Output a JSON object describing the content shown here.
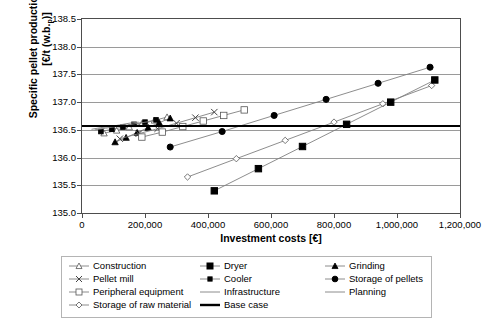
{
  "axes": {
    "ylabel_line1": "Specific pellet production costs",
    "ylabel_line2_pre": "[€/t (w.b.",
    "ylabel_line2_sub": "p",
    "ylabel_line2_post": ")]",
    "ylabel_full": "Specific pellet production costs [€/t (w.b.)p]",
    "xlabel": "Investment costs [€]",
    "yticks": [
      "135.0",
      "135.5",
      "136.0",
      "136.5",
      "137.0",
      "137.5",
      "138.0",
      "138.5"
    ],
    "xticks": [
      "0",
      "200,000",
      "400,000",
      "600,000",
      "800,000",
      "1,000,000",
      "1,200,000"
    ]
  },
  "legend": {
    "entries": [
      {
        "label": "Construction",
        "marker": "open-triangle",
        "col": 0,
        "row": 0
      },
      {
        "label": "Dryer",
        "marker": "filled-square",
        "col": 1,
        "row": 0
      },
      {
        "label": "Grinding",
        "marker": "filled-triangle",
        "col": 2,
        "row": 0
      },
      {
        "label": "Pellet mill",
        "marker": "cross",
        "col": 0,
        "row": 1
      },
      {
        "label": "Cooler",
        "marker": "small-filled-square",
        "col": 1,
        "row": 1
      },
      {
        "label": "Storage of pellets",
        "marker": "filled-circle",
        "col": 2,
        "row": 1
      },
      {
        "label": "Peripheral equipment",
        "marker": "open-square",
        "col": 0,
        "row": 2
      },
      {
        "label": "Infrastructure",
        "marker": "line",
        "col": 1,
        "row": 2
      },
      {
        "label": "Planning",
        "marker": "line",
        "col": 2,
        "row": 2
      },
      {
        "label": "Storage of raw material",
        "marker": "open-diamond",
        "col": 0,
        "row": 3
      },
      {
        "label": "Base case",
        "marker": "thick-line",
        "col": 1,
        "row": 3
      }
    ]
  },
  "colors": {
    "axis": "#4d4d4d",
    "grid": "#9a9a9a",
    "series": "#808080",
    "marker_fill_dark": "#000000",
    "marker_fill_open": "#ffffff",
    "base_case": "#000000"
  },
  "chart_data": {
    "type": "scatter",
    "title": "",
    "xlabel": "Investment costs [€]",
    "ylabel": "Specific pellet production costs [€/t (w.b.)p]",
    "xlim": [
      0,
      1200000
    ],
    "ylim": [
      135.0,
      138.5
    ],
    "grid": true,
    "legend_position": "below",
    "base_case": {
      "label": "Base case",
      "y": 136.57
    },
    "series": [
      {
        "name": "Construction",
        "marker": "open-triangle",
        "x": [
          70000,
          110000,
          150000,
          190000,
          230000,
          270000
        ],
        "y": [
          136.44,
          136.49,
          136.55,
          136.61,
          136.67,
          136.73
        ]
      },
      {
        "name": "Grinding",
        "marker": "filled-triangle",
        "x": [
          105000,
          140000,
          175000,
          210000,
          245000,
          280000
        ],
        "y": [
          136.28,
          136.36,
          136.45,
          136.54,
          136.63,
          136.71
        ]
      },
      {
        "name": "Pellet mill",
        "marker": "cross",
        "x": [
          120000,
          180000,
          240000,
          300000,
          360000,
          420000
        ],
        "y": [
          136.34,
          136.43,
          136.52,
          136.62,
          136.72,
          136.82
        ]
      },
      {
        "name": "Cooler",
        "marker": "small-filled-square",
        "x": [
          60000,
          95000,
          130000,
          165000,
          200000,
          235000
        ],
        "y": [
          136.47,
          136.51,
          136.55,
          136.6,
          136.64,
          136.68
        ]
      },
      {
        "name": "Peripheral equipment",
        "marker": "open-square",
        "x": [
          190000,
          255000,
          320000,
          385000,
          450000,
          515000
        ],
        "y": [
          136.37,
          136.46,
          136.56,
          136.66,
          136.76,
          136.86
        ]
      },
      {
        "name": "Infrastructure",
        "marker": "line",
        "x": [
          40000,
          75000,
          110000,
          145000,
          180000,
          215000
        ],
        "y": [
          136.5,
          136.53,
          136.56,
          136.59,
          136.62,
          136.65
        ]
      },
      {
        "name": "Planning",
        "marker": "line",
        "x": [
          30000,
          60000,
          90000,
          120000,
          150000,
          180000
        ],
        "y": [
          136.51,
          136.54,
          136.56,
          136.59,
          136.62,
          136.64
        ]
      },
      {
        "name": "Storage of raw material",
        "marker": "open-diamond",
        "x": [
          335000,
          490000,
          645000,
          800000,
          955000,
          1110000
        ],
        "y": [
          135.65,
          135.98,
          136.31,
          136.64,
          136.97,
          137.3
        ]
      },
      {
        "name": "Storage of pellets",
        "marker": "filled-circle",
        "x": [
          280000,
          445000,
          610000,
          775000,
          940000,
          1105000
        ],
        "y": [
          136.19,
          136.47,
          136.76,
          137.05,
          137.34,
          137.63
        ]
      },
      {
        "name": "Dryer",
        "marker": "filled-square",
        "x": [
          420000,
          560000,
          700000,
          840000,
          980000,
          1120000
        ],
        "y": [
          135.4,
          135.8,
          136.2,
          136.6,
          137.0,
          137.4
        ]
      }
    ]
  }
}
